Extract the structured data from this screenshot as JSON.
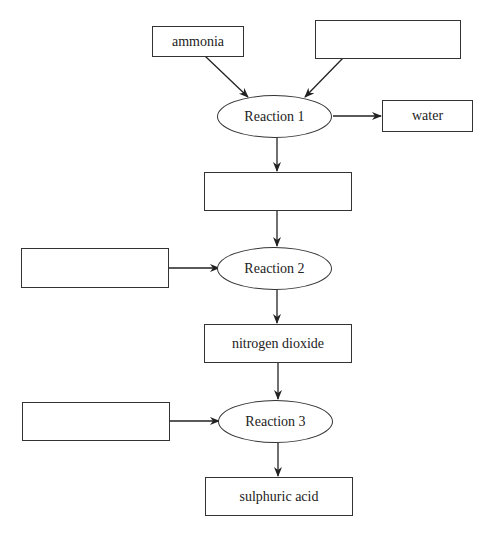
{
  "diagram": {
    "type": "flowchart",
    "nodes": {
      "ammonia": {
        "label": "ammonia",
        "shape": "box"
      },
      "reactant_1": {
        "label": "",
        "shape": "box",
        "blank": true
      },
      "reaction_1": {
        "label": "Reaction 1",
        "shape": "ellipse"
      },
      "water": {
        "label": "water",
        "shape": "box"
      },
      "product_1": {
        "label": "",
        "shape": "box",
        "blank": true
      },
      "reactant_2": {
        "label": "",
        "shape": "box",
        "blank": true
      },
      "reaction_2": {
        "label": "Reaction 2",
        "shape": "ellipse"
      },
      "nitrogen_dioxide": {
        "label": "nitrogen dioxide",
        "shape": "box"
      },
      "reactant_3": {
        "label": "",
        "shape": "box",
        "blank": true
      },
      "reaction_3": {
        "label": "Reaction 3",
        "shape": "ellipse"
      },
      "sulphuric_acid": {
        "label": "sulphuric acid",
        "shape": "box"
      }
    },
    "edges": [
      {
        "from": "ammonia",
        "to": "reaction_1"
      },
      {
        "from": "reactant_1",
        "to": "reaction_1"
      },
      {
        "from": "reaction_1",
        "to": "water"
      },
      {
        "from": "reaction_1",
        "to": "product_1"
      },
      {
        "from": "product_1",
        "to": "reaction_2"
      },
      {
        "from": "reactant_2",
        "to": "reaction_2"
      },
      {
        "from": "reaction_2",
        "to": "nitrogen_dioxide"
      },
      {
        "from": "nitrogen_dioxide",
        "to": "reaction_3"
      },
      {
        "from": "reactant_3",
        "to": "reaction_3"
      },
      {
        "from": "reaction_3",
        "to": "sulphuric_acid"
      }
    ],
    "colors": {
      "stroke": "#333333",
      "background": "#ffffff",
      "text": "#222222"
    }
  }
}
